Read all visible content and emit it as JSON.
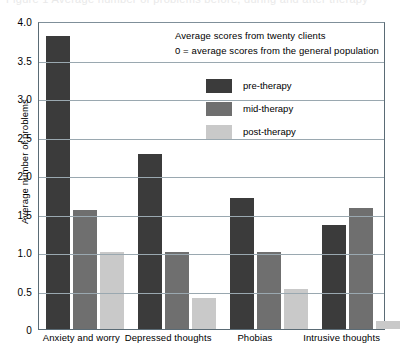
{
  "caption": {
    "cut_off_text": "Figure 1  Average number of problems before, during and after therapy"
  },
  "chart_data": {
    "type": "bar",
    "title": "",
    "xlabel": "",
    "ylabel": "Average number of problems",
    "ylim": [
      0,
      4.0
    ],
    "ytick_labels": [
      "4.0",
      "3.5",
      "3.0",
      "2.5",
      "2.0",
      "1.5",
      "1.0",
      "0.5",
      "0"
    ],
    "ytick_values": [
      4.0,
      3.5,
      3.0,
      2.5,
      2.0,
      1.5,
      1.0,
      0.5,
      0
    ],
    "grid": true,
    "legend_position": "upper-center",
    "categories": [
      "Anxiety and worry",
      "Depressed thoughts",
      "Phobias",
      "Intrusive thoughts"
    ],
    "series": [
      {
        "name": "pre-therapy",
        "color": "#3b3b3b",
        "values": [
          3.8,
          2.27,
          1.7,
          1.35
        ]
      },
      {
        "name": "mid-therapy",
        "color": "#6f6f6f",
        "values": [
          1.55,
          1.0,
          1.0,
          1.57
        ]
      },
      {
        "name": "post-therapy",
        "color": "#c9c9c9",
        "values": [
          1.0,
          0.4,
          0.52,
          0.1
        ]
      }
    ],
    "annotations": [
      "Average scores from twenty clients",
      "0 = average scores from the general population"
    ]
  }
}
